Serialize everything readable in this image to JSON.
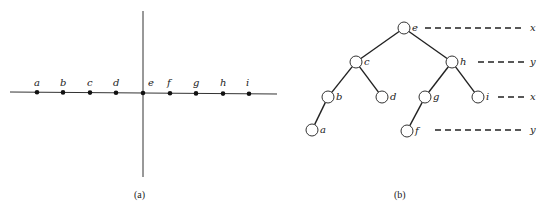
{
  "panel_a": {
    "caption": "(a)",
    "points": [
      {
        "label": "a",
        "x": 37
      },
      {
        "label": "b",
        "x": 63
      },
      {
        "label": "c",
        "x": 90
      },
      {
        "label": "d",
        "x": 116
      },
      {
        "label": "e",
        "x": 143
      },
      {
        "label": "f",
        "x": 170
      },
      {
        "label": "g",
        "x": 196
      },
      {
        "label": "h",
        "x": 223
      },
      {
        "label": "i",
        "x": 249
      }
    ]
  },
  "panel_b": {
    "caption": "(b)",
    "nodes": [
      {
        "label": "e",
        "x": 404,
        "y": 28
      },
      {
        "label": "c",
        "x": 356,
        "y": 62
      },
      {
        "label": "h",
        "x": 452,
        "y": 62
      },
      {
        "label": "b",
        "x": 328,
        "y": 97
      },
      {
        "label": "d",
        "x": 382,
        "y": 97
      },
      {
        "label": "g",
        "x": 425,
        "y": 97
      },
      {
        "label": "i",
        "x": 478,
        "y": 97
      },
      {
        "label": "a",
        "x": 312,
        "y": 130
      },
      {
        "label": "f",
        "x": 407,
        "y": 131
      }
    ],
    "edges": [
      [
        "e",
        "c"
      ],
      [
        "e",
        "h"
      ],
      [
        "c",
        "b"
      ],
      [
        "c",
        "d"
      ],
      [
        "h",
        "g"
      ],
      [
        "h",
        "i"
      ],
      [
        "b",
        "a"
      ],
      [
        "g",
        "f"
      ]
    ],
    "levels": [
      {
        "axis": "x",
        "y": 28,
        "x_start": 425,
        "x_end": 533
      },
      {
        "axis": "y",
        "y": 62,
        "x_start": 478,
        "x_end": 533
      },
      {
        "axis": "x",
        "y": 97,
        "x_start": 498,
        "x_end": 533
      },
      {
        "axis": "y",
        "y": 130,
        "x_start": 435,
        "x_end": 533
      }
    ]
  }
}
